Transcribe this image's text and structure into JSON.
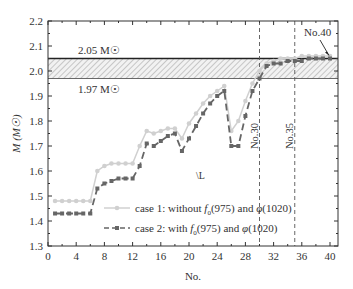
{
  "chart_data": {
    "type": "line",
    "title": "",
    "xlabel": "No.",
    "ylabel": "M (M☉)",
    "xlim": [
      0,
      41
    ],
    "ylim": [
      1.3,
      2.2
    ],
    "x_ticks": [
      0,
      4,
      8,
      12,
      16,
      20,
      24,
      28,
      32,
      36,
      40
    ],
    "y_ticks": [
      1.3,
      1.4,
      1.5,
      1.6,
      1.7,
      1.8,
      1.9,
      2.0,
      2.1,
      2.2
    ],
    "grid": false,
    "x": [
      1,
      2,
      3,
      4,
      5,
      6,
      7,
      8,
      9,
      10,
      11,
      12,
      13,
      14,
      15,
      16,
      17,
      18,
      19,
      20,
      21,
      22,
      23,
      24,
      25,
      26,
      27,
      28,
      29,
      30,
      31,
      32,
      33,
      34,
      35,
      36,
      37,
      38,
      39,
      40
    ],
    "series": [
      {
        "name": "case 1: without f0(975) and φ(1020)",
        "color": "#d0d0d0",
        "marker": "circle",
        "linestyle": "solid",
        "values": [
          1.48,
          1.48,
          1.48,
          1.48,
          1.48,
          1.48,
          1.6,
          1.62,
          1.63,
          1.63,
          1.63,
          1.63,
          1.7,
          1.76,
          1.75,
          1.76,
          1.77,
          1.77,
          1.73,
          1.79,
          1.83,
          1.87,
          1.9,
          1.92,
          1.94,
          1.76,
          1.8,
          1.88,
          1.95,
          2.0,
          2.03,
          2.04,
          2.05,
          2.05,
          2.05,
          2.06,
          2.06,
          2.06,
          2.06,
          2.06
        ]
      },
      {
        "name": "case 2: with f0(975) and φ(1020)",
        "color": "#666666",
        "marker": "square",
        "linestyle": "dashed",
        "values": [
          1.43,
          1.43,
          1.43,
          1.43,
          1.43,
          1.43,
          1.53,
          1.55,
          1.56,
          1.57,
          1.57,
          1.57,
          1.62,
          1.71,
          1.7,
          1.72,
          1.74,
          1.75,
          1.68,
          1.73,
          1.78,
          1.83,
          1.87,
          1.9,
          1.92,
          1.7,
          1.7,
          1.82,
          1.92,
          1.97,
          2.02,
          2.03,
          2.03,
          2.04,
          2.04,
          2.04,
          2.05,
          2.05,
          2.05,
          2.05
        ]
      }
    ],
    "bands": [
      {
        "lower": 1.97,
        "upper": 2.05,
        "upper_label": "2.05 M☉",
        "lower_label": "1.97 M☉"
      }
    ],
    "vlines": [
      {
        "x": 30,
        "label": "No.30"
      },
      {
        "x": 35,
        "label": "No.35"
      }
    ],
    "annotations": [
      {
        "text": "No.40",
        "x": 40,
        "y": 2.05,
        "arrow": true
      },
      {
        "text": "\\L",
        "x": 21,
        "y": 1.57
      }
    ],
    "legend": {
      "position": "lower right",
      "entries": [
        {
          "prefix": "case 1: without ",
          "f": "f",
          "sub": "0",
          "mid": "(975) and ",
          "phi": "φ",
          "suffix": "(1020)"
        },
        {
          "prefix": "case 2: with ",
          "f": "f",
          "sub": "0",
          "mid": "(975) and ",
          "phi": "φ",
          "suffix": "(1020)"
        }
      ]
    }
  }
}
